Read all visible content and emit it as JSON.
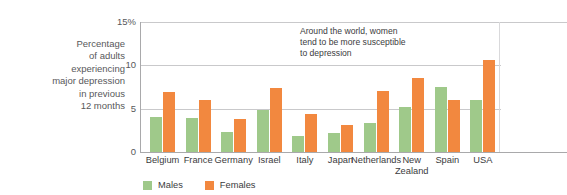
{
  "chart_data": {
    "type": "bar",
    "title": "",
    "subtitle": "",
    "xlabel": "",
    "ylabel": "Percentage of adults experiencing major depression in previous 12 months",
    "ylim": [
      0,
      15
    ],
    "yticks": [
      0,
      5,
      10,
      15
    ],
    "ytick_labels": [
      "0",
      "5",
      "10",
      "15%"
    ],
    "grid": true,
    "legend_position": "bottom-left",
    "categories": [
      "Belgium",
      "France",
      "Germany",
      "Israel",
      "Italy",
      "Japan",
      "Netherlands",
      "New Zealand",
      "Spain",
      "USA"
    ],
    "series": [
      {
        "name": "Males",
        "color": "#9fc98a",
        "values": [
          4.0,
          3.9,
          2.3,
          4.8,
          1.8,
          2.2,
          3.3,
          5.2,
          7.5,
          6.0
        ]
      },
      {
        "name": "Females",
        "color": "#f2883f",
        "values": [
          6.9,
          6.0,
          3.8,
          7.4,
          4.4,
          3.1,
          7.0,
          8.5,
          6.0,
          10.6
        ]
      }
    ],
    "annotations": [
      {
        "name": "women-susceptibility-note",
        "lines": [
          "Around the world, women",
          "tend to be more susceptible",
          "to depression"
        ]
      }
    ]
  },
  "y_caption": {
    "lines": [
      "Percentage",
      "of adults",
      "experiencing",
      "major depression",
      "in previous",
      "12 months"
    ]
  },
  "colors": {
    "males": "#9fc98a",
    "females": "#f2883f",
    "grid": "#c9c9cb",
    "axis": "#a9a9ab",
    "text": "#3b3b3d"
  }
}
